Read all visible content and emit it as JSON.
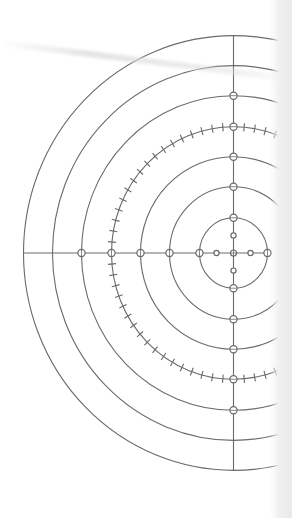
{
  "diagram": {
    "type": "concentric-semicircles",
    "colors": {
      "line": "#6a6a6a",
      "background": "#ffffff",
      "edge_shadow": "#e9e9e9"
    },
    "center": {
      "x": 233.5,
      "y": 253
    },
    "y_scale": 1.035,
    "radii": [
      34,
      64,
      93,
      122,
      152,
      181,
      210
    ],
    "ticked_radius": 122,
    "tick_step_deg": 5,
    "tick_length": 8,
    "axis": {
      "horizontal": {
        "x_from": 23,
        "x_to": 268
      },
      "vertical": {
        "y_from": 36,
        "y_to": 470
      }
    },
    "axis_nodes": {
      "horizontal_radii": [
        -17,
        17,
        -34,
        34,
        -64,
        -93,
        -122,
        -152
      ],
      "vertical_radii": [
        -17,
        17,
        -34,
        34,
        -64,
        64,
        -93,
        93,
        -122,
        122,
        -152,
        152
      ],
      "small_dot_radius": 17
    }
  }
}
